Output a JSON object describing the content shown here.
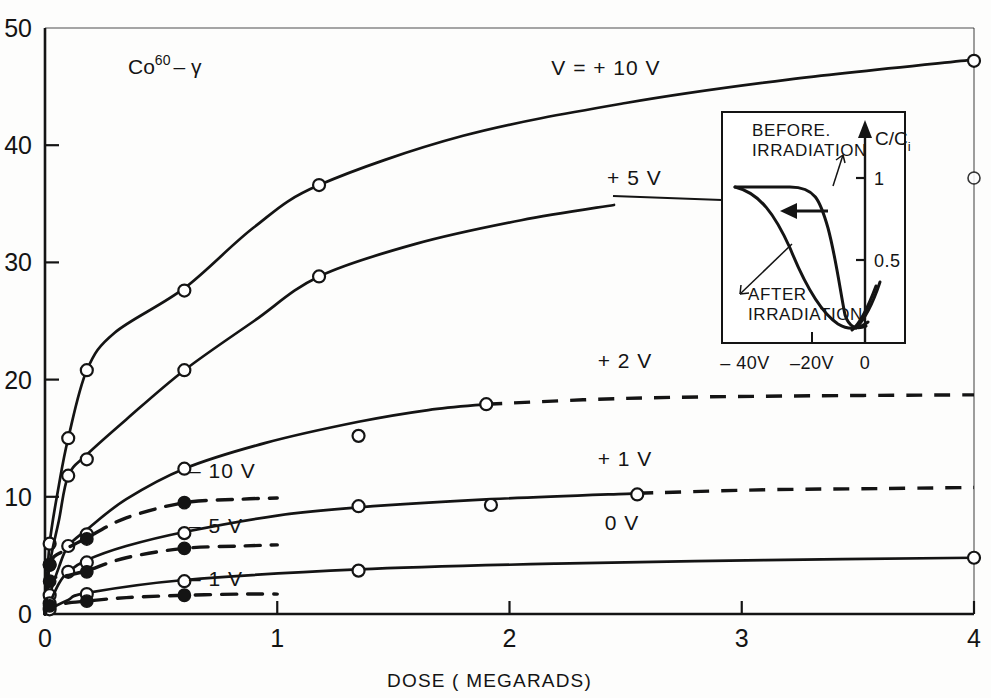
{
  "figure": {
    "source_label_main": "Co",
    "source_label_sup": "60",
    "source_label_tail": "– γ",
    "background": "#fdfdfc",
    "ink": "#141414"
  },
  "axes": {
    "x": {
      "title": "DOSE ( MEGARADS)",
      "ticks": [
        "0",
        "1",
        "2",
        "3",
        "4"
      ],
      "min": 0,
      "max": 4
    },
    "y": {
      "title": "",
      "ticks": [
        "0",
        "10",
        "20",
        "30",
        "40",
        "50"
      ],
      "min": 0,
      "max": 50
    }
  },
  "chart_data": {
    "type": "line",
    "xlabel": "DOSE ( MEGARADS)",
    "ylabel": "",
    "xlim": [
      0,
      4
    ],
    "ylim": [
      0,
      50
    ],
    "grid": false,
    "legend": "inline-curve-labels",
    "series": [
      {
        "name": "V = +10 V",
        "label": "V = + 10 V",
        "marker": "open-circle",
        "style": "solid",
        "label_x": 2.18,
        "label_y": 46.0,
        "points": [
          {
            "x": 0.02,
            "y": 6.0
          },
          {
            "x": 0.1,
            "y": 15.0
          },
          {
            "x": 0.18,
            "y": 20.8
          },
          {
            "x": 0.6,
            "y": 27.6
          },
          {
            "x": 1.18,
            "y": 36.6
          },
          {
            "x": 4.0,
            "y": 47.2
          }
        ],
        "curve": [
          {
            "x": 0.0,
            "y": 0.0
          },
          {
            "x": 0.02,
            "y": 6.0
          },
          {
            "x": 0.06,
            "y": 11.0
          },
          {
            "x": 0.1,
            "y": 15.0
          },
          {
            "x": 0.18,
            "y": 20.8
          },
          {
            "x": 0.3,
            "y": 24.0
          },
          {
            "x": 0.6,
            "y": 27.8
          },
          {
            "x": 0.9,
            "y": 33.0
          },
          {
            "x": 1.18,
            "y": 36.6
          },
          {
            "x": 1.8,
            "y": 40.8
          },
          {
            "x": 2.5,
            "y": 43.6
          },
          {
            "x": 3.2,
            "y": 45.6
          },
          {
            "x": 4.0,
            "y": 47.3
          }
        ]
      },
      {
        "name": "+5V",
        "label": "+ 5 V",
        "marker": "open-circle",
        "style": "solid",
        "label_x": 2.42,
        "label_y": 36.6,
        "points": [
          {
            "x": 0.02,
            "y": 4.2
          },
          {
            "x": 0.1,
            "y": 11.8
          },
          {
            "x": 0.18,
            "y": 13.2
          },
          {
            "x": 0.6,
            "y": 20.8
          },
          {
            "x": 1.18,
            "y": 28.8
          }
        ],
        "curve": [
          {
            "x": 0.0,
            "y": 0.0
          },
          {
            "x": 0.02,
            "y": 4.2
          },
          {
            "x": 0.06,
            "y": 8.0
          },
          {
            "x": 0.1,
            "y": 11.8
          },
          {
            "x": 0.18,
            "y": 13.6
          },
          {
            "x": 0.35,
            "y": 16.6
          },
          {
            "x": 0.6,
            "y": 20.8
          },
          {
            "x": 0.9,
            "y": 25.0
          },
          {
            "x": 1.18,
            "y": 28.8
          },
          {
            "x": 1.6,
            "y": 31.6
          },
          {
            "x": 2.05,
            "y": 33.6
          },
          {
            "x": 2.45,
            "y": 34.9
          }
        ]
      },
      {
        "name": "+2V",
        "label": "+ 2 V",
        "marker": "open-circle",
        "style": "solid-then-dashed",
        "label_x": 2.38,
        "label_y": 21.0,
        "dash_from_x": 1.9,
        "points": [
          {
            "x": 0.02,
            "y": 1.6
          },
          {
            "x": 0.1,
            "y": 5.8
          },
          {
            "x": 0.18,
            "y": 6.8
          },
          {
            "x": 0.6,
            "y": 12.4
          },
          {
            "x": 1.35,
            "y": 15.2
          },
          {
            "x": 1.9,
            "y": 17.9
          }
        ],
        "curve": [
          {
            "x": 0.0,
            "y": 0.0
          },
          {
            "x": 0.02,
            "y": 1.6
          },
          {
            "x": 0.06,
            "y": 4.0
          },
          {
            "x": 0.1,
            "y": 5.8
          },
          {
            "x": 0.18,
            "y": 7.2
          },
          {
            "x": 0.35,
            "y": 9.8
          },
          {
            "x": 0.6,
            "y": 12.4
          },
          {
            "x": 0.95,
            "y": 14.6
          },
          {
            "x": 1.35,
            "y": 16.4
          },
          {
            "x": 1.65,
            "y": 17.4
          },
          {
            "x": 1.9,
            "y": 17.9
          }
        ],
        "dashed_curve": [
          {
            "x": 1.9,
            "y": 17.9
          },
          {
            "x": 2.5,
            "y": 18.4
          },
          {
            "x": 3.2,
            "y": 18.6
          },
          {
            "x": 4.0,
            "y": 18.7
          }
        ]
      },
      {
        "name": "+1V",
        "label": "+ 1 V",
        "marker": "open-circle",
        "style": "solid-then-dashed",
        "label_x": 2.38,
        "label_y": 12.6,
        "dash_from_x": 2.55,
        "points": [
          {
            "x": 0.02,
            "y": 0.9
          },
          {
            "x": 0.1,
            "y": 3.6
          },
          {
            "x": 0.18,
            "y": 4.4
          },
          {
            "x": 0.6,
            "y": 6.9
          },
          {
            "x": 1.35,
            "y": 9.2
          },
          {
            "x": 1.92,
            "y": 9.3
          },
          {
            "x": 2.55,
            "y": 10.2
          }
        ],
        "curve": [
          {
            "x": 0.0,
            "y": 0.0
          },
          {
            "x": 0.02,
            "y": 0.9
          },
          {
            "x": 0.06,
            "y": 2.6
          },
          {
            "x": 0.1,
            "y": 3.6
          },
          {
            "x": 0.18,
            "y": 4.6
          },
          {
            "x": 0.35,
            "y": 5.8
          },
          {
            "x": 0.6,
            "y": 7.0
          },
          {
            "x": 1.0,
            "y": 8.4
          },
          {
            "x": 1.35,
            "y": 9.1
          },
          {
            "x": 1.92,
            "y": 9.8
          },
          {
            "x": 2.55,
            "y": 10.3
          }
        ],
        "dashed_curve": [
          {
            "x": 2.55,
            "y": 10.3
          },
          {
            "x": 3.1,
            "y": 10.6
          },
          {
            "x": 3.6,
            "y": 10.7
          },
          {
            "x": 4.0,
            "y": 10.8
          }
        ]
      },
      {
        "name": "0V",
        "label": "0 V",
        "marker": "open-circle",
        "style": "solid",
        "label_x": 2.41,
        "label_y": 7.2,
        "points": [
          {
            "x": 0.02,
            "y": 0.4
          },
          {
            "x": 0.18,
            "y": 1.7
          },
          {
            "x": 0.6,
            "y": 2.8
          },
          {
            "x": 1.35,
            "y": 3.7
          },
          {
            "x": 4.0,
            "y": 4.8
          }
        ],
        "curve": [
          {
            "x": 0.0,
            "y": 0.0
          },
          {
            "x": 0.02,
            "y": 0.4
          },
          {
            "x": 0.1,
            "y": 1.2
          },
          {
            "x": 0.18,
            "y": 1.8
          },
          {
            "x": 0.6,
            "y": 2.9
          },
          {
            "x": 1.35,
            "y": 3.8
          },
          {
            "x": 2.2,
            "y": 4.3
          },
          {
            "x": 3.1,
            "y": 4.6
          },
          {
            "x": 4.0,
            "y": 4.8
          }
        ]
      },
      {
        "name": "-10V",
        "label": "– 10 V",
        "marker": "filled-circle",
        "style": "dashed",
        "label_x": 0.62,
        "label_y": 11.6,
        "points": [
          {
            "x": 0.02,
            "y": 4.2
          },
          {
            "x": 0.18,
            "y": 6.4
          },
          {
            "x": 0.6,
            "y": 9.5
          }
        ],
        "curve": [
          {
            "x": 0.0,
            "y": 0.0
          },
          {
            "x": 0.02,
            "y": 4.2
          },
          {
            "x": 0.08,
            "y": 5.4
          },
          {
            "x": 0.18,
            "y": 6.5
          },
          {
            "x": 0.35,
            "y": 8.2
          },
          {
            "x": 0.6,
            "y": 9.5
          },
          {
            "x": 0.85,
            "y": 9.8
          },
          {
            "x": 1.0,
            "y": 9.9
          }
        ]
      },
      {
        "name": "-5V",
        "label": "– 5 V",
        "marker": "filled-circle",
        "style": "dashed",
        "label_x": 0.62,
        "label_y": 6.9,
        "points": [
          {
            "x": 0.02,
            "y": 2.8
          },
          {
            "x": 0.18,
            "y": 3.6
          },
          {
            "x": 0.6,
            "y": 5.6
          }
        ],
        "curve": [
          {
            "x": 0.0,
            "y": 0.0
          },
          {
            "x": 0.02,
            "y": 2.8
          },
          {
            "x": 0.08,
            "y": 3.2
          },
          {
            "x": 0.18,
            "y": 3.7
          },
          {
            "x": 0.35,
            "y": 4.8
          },
          {
            "x": 0.6,
            "y": 5.6
          },
          {
            "x": 0.85,
            "y": 5.8
          },
          {
            "x": 1.0,
            "y": 5.9
          }
        ]
      },
      {
        "name": "-1V",
        "label": "– 1 V",
        "marker": "filled-circle",
        "style": "dashed",
        "label_x": 0.62,
        "label_y": 2.4,
        "points": [
          {
            "x": 0.02,
            "y": 0.7
          },
          {
            "x": 0.18,
            "y": 1.1
          },
          {
            "x": 0.6,
            "y": 1.6
          }
        ],
        "curve": [
          {
            "x": 0.0,
            "y": 0.0
          },
          {
            "x": 0.02,
            "y": 0.7
          },
          {
            "x": 0.08,
            "y": 0.9
          },
          {
            "x": 0.18,
            "y": 1.1
          },
          {
            "x": 0.35,
            "y": 1.4
          },
          {
            "x": 0.6,
            "y": 1.6
          },
          {
            "x": 0.85,
            "y": 1.7
          },
          {
            "x": 1.0,
            "y": 1.7
          }
        ]
      }
    ],
    "stray_markers": [
      {
        "x": 4.0,
        "y": 37.2,
        "marker": "open-circle"
      }
    ]
  },
  "inset": {
    "y_axis_label_main": "C/C",
    "y_axis_label_sub": "i",
    "y_ticks": [
      "1",
      "0.5"
    ],
    "x_ticks": [
      "– 40V",
      "–20V",
      "0"
    ],
    "annotations": [
      {
        "id": "before",
        "line1": "BEFORE.",
        "line2": "IRRADIATION"
      },
      {
        "id": "after",
        "line1": "AFTER",
        "line2": "IRRADIATION"
      }
    ],
    "shift_arrow": "leftward-shift-arrow"
  }
}
